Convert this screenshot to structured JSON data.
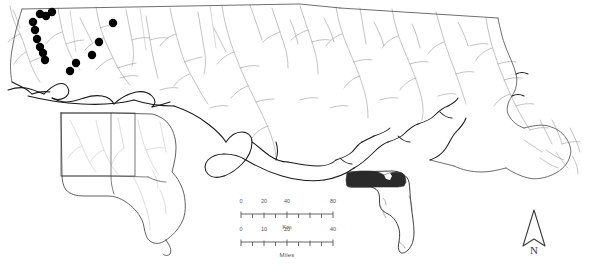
{
  "figure": {
    "background_color": "#ffffff",
    "width": 596,
    "height": 264
  },
  "colors": {
    "coastline": "#1a1a1a",
    "state_boundary": "#4a4a4a",
    "river": "#8a8a8a",
    "county_line": "#9a9a9a",
    "occurrence_point": "#000000",
    "highlight_fill": "#2a2a2a",
    "scalebar": "#555555",
    "north_arrow": "#3a3a3a"
  },
  "main_map": {
    "name": "main-distribution-map",
    "description": "Florida panhandle, southern Alabama and southwest Georgia with drainage network and sample localities",
    "occurrence_points": {
      "label": "occurrence-locality",
      "count": 14,
      "radius": 4.2,
      "coords": [
        [
          40,
          14
        ],
        [
          46,
          16
        ],
        [
          52,
          12
        ],
        [
          33,
          22
        ],
        [
          35,
          30
        ],
        [
          37,
          39
        ],
        [
          40,
          47
        ],
        [
          43,
          53
        ],
        [
          45,
          60
        ],
        [
          113,
          23
        ],
        [
          99,
          42
        ],
        [
          92,
          55
        ],
        [
          76,
          63
        ],
        [
          70,
          71
        ]
      ]
    }
  },
  "inset_states": {
    "name": "states-inset-map",
    "description": "Alabama, Georgia and Florida reference inset with study-area extent box",
    "extent_box": {
      "x": 61,
      "y": 113,
      "width": 74,
      "height": 63
    }
  },
  "inset_florida": {
    "name": "florida-locator-inset",
    "description": "Florida state outline with panhandle study area shaded black",
    "highlight_label": "study-area-panhandle"
  },
  "km_scalebar": {
    "name": "km-scale-bar",
    "caption": "Km",
    "unit": "Km",
    "bar_length_px": 92,
    "segments": 8,
    "tick_labels": [
      {
        "text": "0",
        "pos_pct": 0
      },
      {
        "text": "20",
        "pos_pct": 25
      },
      {
        "text": "40",
        "pos_pct": 50
      },
      {
        "text": "80",
        "pos_pct": 100
      }
    ]
  },
  "miles_scalebar": {
    "name": "miles-scale-bar",
    "caption": "Miles",
    "unit": "Miles",
    "bar_length_px": 92,
    "segments": 8,
    "tick_labels": [
      {
        "text": "0",
        "pos_pct": 0
      },
      {
        "text": "10",
        "pos_pct": 25
      },
      {
        "text": "20",
        "pos_pct": 50
      },
      {
        "text": "40",
        "pos_pct": 100
      }
    ]
  },
  "north_arrow": {
    "name": "north-arrow",
    "label": "N"
  }
}
